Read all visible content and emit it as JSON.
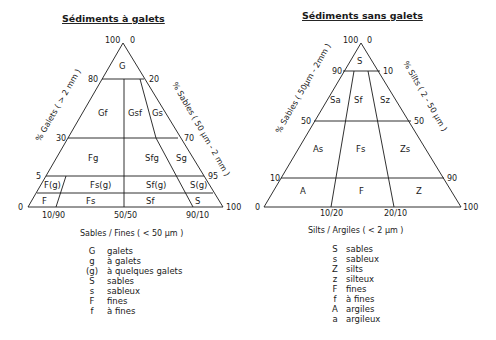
{
  "left_diagram": {
    "title": "Sédiments à galets",
    "left_axis_label": "% Galets ( > 2 mm )",
    "right_axis_label": "% Sables ( 50 µm - 2 mm )",
    "bottom_axis_label": "Sables / Fines ( < 50 µm )",
    "left_ticks": [
      "100",
      "80",
      "30",
      "5",
      "0"
    ],
    "right_ticks": [
      "0",
      "20",
      "70",
      "95",
      "100"
    ],
    "bottom_ticks": [
      "10/90",
      "50/50",
      "90/10"
    ],
    "zones": [
      "G",
      "Gf",
      "Gsf",
      "Gs",
      "Fg",
      "Sfg",
      "Sg",
      "F(g)",
      "Fs(g)",
      "Sf(g)",
      "S(g)",
      "F",
      "Fs",
      "Sf",
      "S"
    ],
    "legend": [
      {
        "sym": "G",
        "desc": "galets"
      },
      {
        "sym": "g",
        "desc": "à galets"
      },
      {
        "sym": "(g)",
        "desc": "à quelques galets"
      },
      {
        "sym": "S",
        "desc": "sables"
      },
      {
        "sym": "s",
        "desc": "sableux"
      },
      {
        "sym": "F",
        "desc": "fines"
      },
      {
        "sym": "f",
        "desc": "à fines"
      }
    ]
  },
  "right_diagram": {
    "title": "Sédiments sans galets",
    "left_axis_label": "% Sables ( 50µm - 2mm )",
    "right_axis_label": "% Silts ( 2 - 50 µm )",
    "bottom_axis_label": "Silts / Argiles ( < 2 µm )",
    "left_ticks": [
      "100",
      "90",
      "50",
      "10",
      "0"
    ],
    "right_ticks": [
      "0",
      "10",
      "50",
      "90",
      "100"
    ],
    "bottom_ticks": [
      "10/20",
      "20/10"
    ],
    "zones": [
      "S",
      "Sa",
      "Sf",
      "Sz",
      "As",
      "Fs",
      "Zs",
      "A",
      "F",
      "Z"
    ],
    "legend": [
      {
        "sym": "S",
        "desc": "sables"
      },
      {
        "sym": "s",
        "desc": "sableux"
      },
      {
        "sym": "Z",
        "desc": "silts"
      },
      {
        "sym": "z",
        "desc": "silteux"
      },
      {
        "sym": "F",
        "desc": "fines"
      },
      {
        "sym": "f",
        "desc": "à fines"
      },
      {
        "sym": "A",
        "desc": "argiles"
      },
      {
        "sym": "a",
        "desc": "argileux"
      }
    ]
  }
}
